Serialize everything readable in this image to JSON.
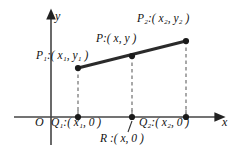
{
  "figure": {
    "background_color": "#ffffff",
    "ink_color": "#111111",
    "segment_color": "#2b2b2b",
    "dashed_color": "#8c8c8c"
  },
  "axes": {
    "x_label": "x",
    "y_label": "y",
    "origin_label": "O"
  },
  "labels": {
    "p1": "P₁:( x₁, y₁ )",
    "p": "P:( x, y )",
    "p2": "P₂:( x₂, y₂ )",
    "q1": "Q₁:( x₁, 0 )",
    "q2": "Q₂:( x₂, 0 )",
    "r": "R :( x, 0 )"
  },
  "points": [
    {
      "name": "P1",
      "px": 78,
      "py": 68,
      "label": "P₁:( x₁, y₁ )"
    },
    {
      "name": "P",
      "px": 132,
      "py": 56,
      "label": "P:( x, y )"
    },
    {
      "name": "P2",
      "px": 186,
      "py": 41,
      "label": "P₂:( x₂, y₂ )"
    },
    {
      "name": "Q1",
      "px": 78,
      "py": 117,
      "label": "Q₁:( x₁, 0 )"
    },
    {
      "name": "R",
      "px": 132,
      "py": 117,
      "label": "R :( x, 0 )"
    },
    {
      "name": "Q2",
      "px": 186,
      "py": 117,
      "label": "Q₂:( x₂, 0 )"
    }
  ],
  "geometry": {
    "x_axis_y": 117,
    "y_axis_x": 51,
    "x_axis_end": 224,
    "y_axis_top": 12
  }
}
